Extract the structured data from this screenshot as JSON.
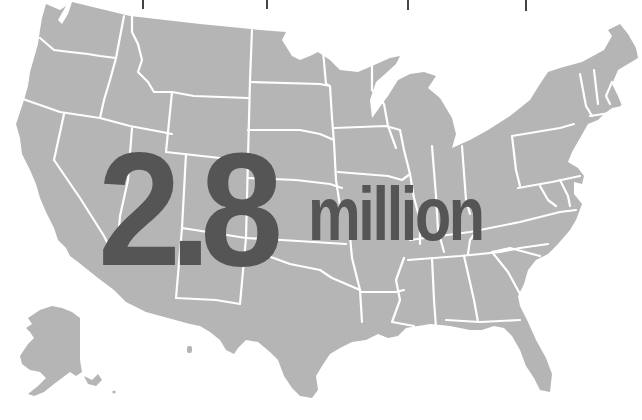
{
  "map": {
    "subject": "United States",
    "fill_color": "#b5b5b5",
    "border_color": "#ffffff",
    "background_color": "#ffffff",
    "insets": [
      "Alaska",
      "Hawaii"
    ]
  },
  "ticks": {
    "color": "#444444",
    "x_positions": [
      143,
      267,
      408,
      526
    ]
  },
  "headline": {
    "number": "2.8",
    "unit": "million",
    "color": "#555555"
  }
}
